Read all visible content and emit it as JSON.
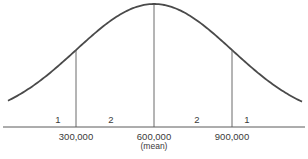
{
  "chart_data": {
    "type": "line",
    "title": "",
    "xlabel": "",
    "ylabel": "",
    "distribution": {
      "family": "normal",
      "mean": 600000,
      "std_dev": 300000
    },
    "xlim": [
      -50000,
      1200000
    ],
    "x_ticks": [
      {
        "value": 300000,
        "label": "300,000"
      },
      {
        "value": 600000,
        "label": "600,000",
        "note": "(mean)"
      },
      {
        "value": 900000,
        "label": "900,000"
      }
    ],
    "vertical_markers": [
      300000,
      600000,
      900000
    ],
    "regions": [
      {
        "label": "1",
        "from": -50000,
        "to": 300000
      },
      {
        "label": "2",
        "from": 300000,
        "to": 600000
      },
      {
        "label": "2",
        "from": 600000,
        "to": 900000
      },
      {
        "label": "1",
        "from": 900000,
        "to": 1200000
      }
    ],
    "grid": false,
    "legend": "none",
    "colors": {
      "curve": "#4a4a4a",
      "axis": "#5a5a5a",
      "text": "#3a3a3a"
    }
  }
}
